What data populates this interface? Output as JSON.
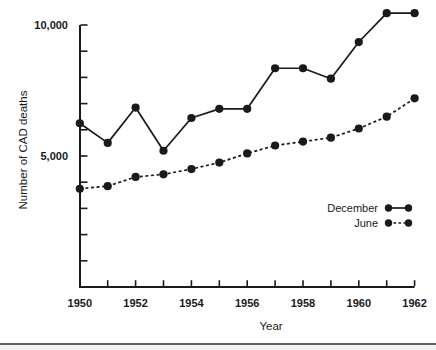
{
  "page": {
    "background": "#ffffff",
    "ink_color": "#1a1a1a",
    "bottom_rule_color": "#606060",
    "bottom_strip_color": "#f2f2f2"
  },
  "chart_data": {
    "type": "line",
    "title": "",
    "xlabel": "Year",
    "ylabel": "Number of CAD deaths",
    "x": [
      1950,
      1951,
      1952,
      1953,
      1954,
      1955,
      1956,
      1957,
      1958,
      1959,
      1960,
      1961,
      1962
    ],
    "series": [
      {
        "name": "December",
        "line_style": "solid",
        "marker": "filled-circle",
        "values": [
          6250,
          5500,
          6850,
          5200,
          6450,
          6800,
          6800,
          8350,
          8350,
          7950,
          9350,
          10450,
          10450
        ]
      },
      {
        "name": "June",
        "line_style": "dashed",
        "marker": "filled-circle",
        "values": [
          3750,
          3850,
          4200,
          4300,
          4500,
          4750,
          5100,
          5400,
          5550,
          5700,
          6050,
          6500,
          7200
        ]
      }
    ],
    "xlim": [
      1950,
      1962
    ],
    "ylim": [
      0,
      10000
    ],
    "x_ticks_labeled": [
      1950,
      1952,
      1954,
      1956,
      1958,
      1960,
      1962
    ],
    "x_tick_labels": [
      "1950",
      "1952",
      "1954",
      "1956",
      "1958",
      "1960",
      "1962"
    ],
    "x_minor_tick_step": 1,
    "y_ticks_labeled": [
      5000,
      10000
    ],
    "y_tick_labels": [
      "5,000",
      "10,000"
    ],
    "y_minor_tick_step": 1000,
    "grid": false,
    "legend": {
      "position": "inside-right",
      "entries": [
        {
          "label": "December",
          "line_style": "solid"
        },
        {
          "label": "June",
          "line_style": "dashed"
        }
      ]
    }
  }
}
